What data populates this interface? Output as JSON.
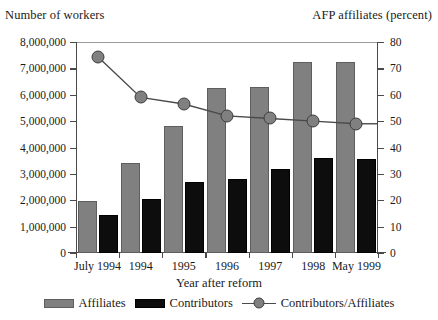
{
  "chart_data": {
    "type": "bar",
    "title": "",
    "xlabel": "Year after reform",
    "ylabel": "Number of workers",
    "y2label": "AFP affiliates (percent)",
    "categories": [
      "July 1994",
      "1994",
      "1995",
      "1996",
      "1997",
      "1998",
      "May 1999"
    ],
    "ylim": [
      0,
      8000000
    ],
    "y2lim": [
      0,
      80
    ],
    "ytick_labels": [
      "0",
      "1,000,000",
      "2,000,000",
      "3,000,000",
      "4,000,000",
      "5,000,000",
      "6,000,000",
      "7,000,000",
      "8,000,000"
    ],
    "ytick_values": [
      0,
      1000000,
      2000000,
      3000000,
      4000000,
      5000000,
      6000000,
      7000000,
      8000000
    ],
    "y2tick_labels": [
      "0",
      "10",
      "20",
      "30",
      "40",
      "50",
      "60",
      "70",
      "80"
    ],
    "y2tick_values": [
      0,
      10,
      20,
      30,
      40,
      50,
      60,
      70,
      80
    ],
    "grid": false,
    "legend_position": "bottom",
    "series": [
      {
        "name": "Affiliates",
        "type": "bar",
        "axis": "left",
        "color": "#808080",
        "values": [
          1980000,
          3400000,
          4800000,
          6250000,
          6300000,
          7250000,
          7250000
        ]
      },
      {
        "name": "Contributors",
        "type": "bar",
        "axis": "left",
        "color": "#0d0d0d",
        "values": [
          1450000,
          2040000,
          2700000,
          2800000,
          3200000,
          3600000,
          3550000
        ]
      },
      {
        "name": "Contributors/Affiliates",
        "type": "line",
        "axis": "right",
        "color": "#808080",
        "values": [
          74.5,
          59.0,
          56.5,
          52.0,
          51.0,
          50.0,
          49.0
        ]
      }
    ]
  },
  "legend": {
    "items": [
      {
        "label": "Affiliates"
      },
      {
        "label": "Contributors"
      },
      {
        "label": "Contributors/Affiliates"
      }
    ]
  }
}
